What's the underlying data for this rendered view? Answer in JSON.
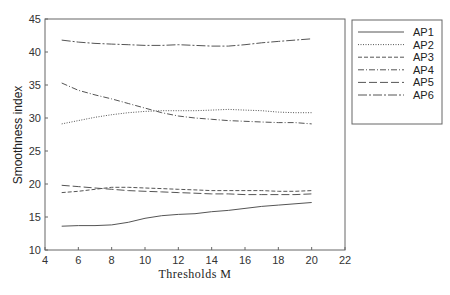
{
  "chart_data": {
    "type": "line",
    "title": "",
    "xlabel": "Thresholds M",
    "ylabel": "Smoothness index",
    "xlim": [
      4,
      22
    ],
    "ylim": [
      10,
      45
    ],
    "xticks": [
      4,
      6,
      8,
      10,
      12,
      14,
      16,
      18,
      20,
      22
    ],
    "yticks": [
      10,
      15,
      20,
      25,
      30,
      35,
      40,
      45
    ],
    "grid": false,
    "legend_position": "outside-right-top",
    "x": [
      5,
      6,
      7,
      8,
      9,
      10,
      11,
      12,
      13,
      14,
      15,
      16,
      17,
      18,
      19,
      20
    ],
    "series": [
      {
        "name": "AP1",
        "style": "solid",
        "values": [
          13.6,
          13.7,
          13.7,
          13.8,
          14.2,
          14.8,
          15.2,
          15.4,
          15.5,
          15.8,
          16.0,
          16.3,
          16.6,
          16.8,
          17.0,
          17.2
        ]
      },
      {
        "name": "AP2",
        "style": "dotted",
        "values": [
          29.1,
          29.6,
          30.1,
          30.5,
          30.8,
          31.0,
          31.1,
          31.1,
          31.1,
          31.2,
          31.3,
          31.2,
          31.1,
          30.9,
          30.8,
          30.8
        ]
      },
      {
        "name": "AP3",
        "style": "short-dash",
        "values": [
          18.7,
          18.9,
          19.2,
          19.5,
          19.5,
          19.4,
          19.3,
          19.2,
          19.1,
          19.0,
          19.0,
          19.0,
          19.0,
          18.9,
          18.9,
          19.0
        ]
      },
      {
        "name": "AP4",
        "style": "dash-dot",
        "values": [
          35.3,
          34.2,
          33.5,
          32.9,
          32.2,
          31.5,
          30.8,
          30.3,
          30.0,
          29.8,
          29.6,
          29.5,
          29.4,
          29.3,
          29.3,
          29.1
        ]
      },
      {
        "name": "AP5",
        "style": "long-dash",
        "values": [
          19.8,
          19.6,
          19.4,
          19.2,
          19.0,
          18.9,
          18.8,
          18.7,
          18.6,
          18.5,
          18.5,
          18.4,
          18.4,
          18.4,
          18.4,
          18.5
        ]
      },
      {
        "name": "AP6",
        "style": "long-dash-dot",
        "values": [
          41.8,
          41.5,
          41.3,
          41.2,
          41.1,
          41.0,
          41.0,
          41.1,
          41.0,
          40.9,
          40.9,
          41.1,
          41.4,
          41.6,
          41.8,
          42.0
        ]
      }
    ]
  },
  "legend": {
    "items": [
      "AP1",
      "AP2",
      "AP3",
      "AP4",
      "AP5",
      "AP6"
    ]
  },
  "styles": {
    "line_color": "#555555",
    "axis_color": "#666666"
  }
}
